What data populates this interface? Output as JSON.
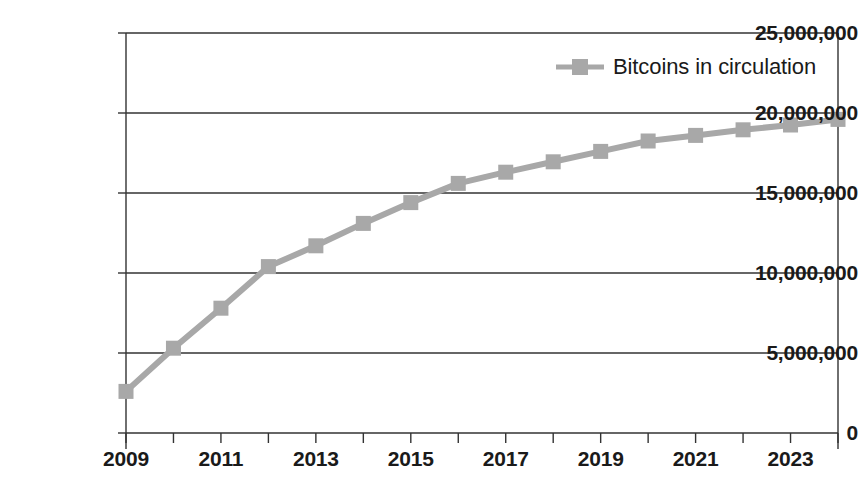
{
  "title_remnant": "",
  "legend": {
    "entries": [
      {
        "label": "Bitcoins in circulation",
        "color": "#a8a8a8",
        "marker": "square"
      }
    ]
  },
  "axes": {
    "y_ticks": [
      "0",
      "5,000,000",
      "10,000,000",
      "15,000,000",
      "20,000,000",
      "25,000,000"
    ],
    "x_ticks_labeled": [
      "2009",
      "2011",
      "2013",
      "2015",
      "2017",
      "2019",
      "2021",
      "2023"
    ]
  },
  "chart_data": {
    "type": "line",
    "title": "",
    "subtitle": "",
    "xlabel": "",
    "ylabel": "",
    "x": [
      2009,
      2010,
      2011,
      2012,
      2013,
      2014,
      2015,
      2016,
      2017,
      2018,
      2019,
      2020,
      2021,
      2022,
      2023,
      2024
    ],
    "series": [
      {
        "name": "Bitcoins in circulation",
        "color": "#a8a8a8",
        "marker": "square",
        "values": [
          2600000,
          5300000,
          7800000,
          10400000,
          11700000,
          13100000,
          14400000,
          15600000,
          16300000,
          16950000,
          17600000,
          18250000,
          18600000,
          18950000,
          19250000,
          19600000
        ]
      }
    ],
    "xlim": [
      2009,
      2024
    ],
    "ylim": [
      0,
      25000000
    ],
    "y_ticks": [
      0,
      5000000,
      10000000,
      15000000,
      20000000,
      25000000
    ],
    "x_ticks": [
      2009,
      2010,
      2011,
      2012,
      2013,
      2014,
      2015,
      2016,
      2017,
      2018,
      2019,
      2020,
      2021,
      2022,
      2023,
      2024
    ],
    "x_tick_labels_every": 2,
    "grid": "horizontal",
    "legend_position": "top-right"
  }
}
